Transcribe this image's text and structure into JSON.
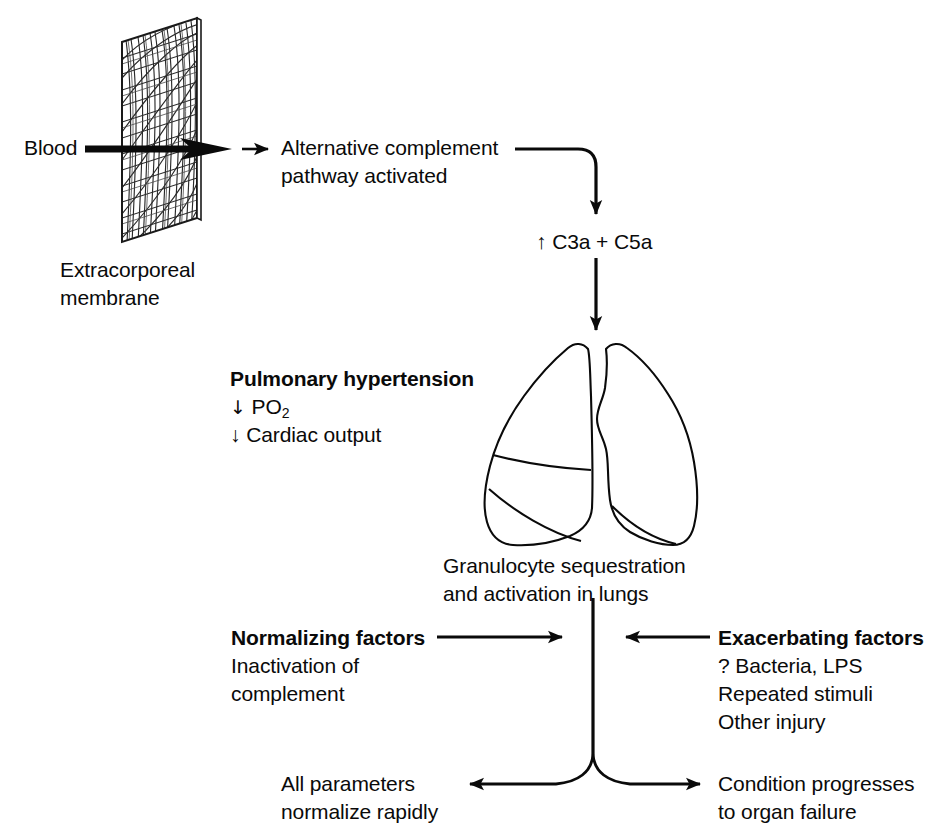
{
  "diagram": {
    "type": "flow-diagram",
    "stroke_color": "#0a0a0a",
    "background_color": "#ffffff"
  },
  "nodes": {
    "blood": {
      "label": "Blood"
    },
    "membrane_caption": {
      "line1": "Extracorporeal",
      "line2": "membrane"
    },
    "membrane_illustration": {
      "icon": "woven-mesh-membrane-icon"
    },
    "complement": {
      "line1": "Alternative complement",
      "line2": "pathway activated"
    },
    "anaphylatoxins": {
      "label": "↑ C3a + C5a"
    },
    "pulmonary": {
      "heading": "Pulmonary hypertension",
      "line2_arrow": "↓",
      "line2_text": "PO",
      "line2_sub": "2",
      "line3": "↓ Cardiac output"
    },
    "lungs_illustration": {
      "icon": "lungs-icon"
    },
    "granulocyte": {
      "line1": "Granulocyte sequestration",
      "line2": "and activation in lungs"
    },
    "normalizing": {
      "heading": "Normalizing factors",
      "line2": "Inactivation of",
      "line3": "complement"
    },
    "exacerbating": {
      "heading": "Exacerbating factors",
      "line2": "? Bacteria, LPS",
      "line3": "Repeated stimuli",
      "line4": "Other injury"
    },
    "outcome_good": {
      "line1": "All parameters",
      "line2": "normalize rapidly"
    },
    "outcome_bad": {
      "line1": "Condition progresses",
      "line2": "to organ failure"
    }
  },
  "connectors": [
    {
      "name": "blood-to-membrane-arrow",
      "kind": "thick-right-arrow"
    },
    {
      "name": "membrane-to-complement-arrow",
      "kind": "thin-right-arrow"
    },
    {
      "name": "complement-to-c3a-elbow-arrow",
      "kind": "elbow-down-arrow"
    },
    {
      "name": "c3a-to-lungs-arrow",
      "kind": "down-arrow"
    },
    {
      "name": "granulocyte-trunk-line",
      "kind": "vertical-line"
    },
    {
      "name": "normalizing-to-trunk-arrow",
      "kind": "right-arrow"
    },
    {
      "name": "exacerbating-to-trunk-arrow",
      "kind": "left-arrow"
    },
    {
      "name": "trunk-split-left-arrow",
      "kind": "curve-left-arrow"
    },
    {
      "name": "trunk-split-right-arrow",
      "kind": "curve-right-arrow"
    }
  ]
}
